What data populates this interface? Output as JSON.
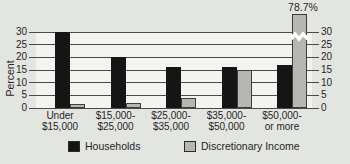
{
  "chart_data": {
    "type": "bar",
    "title": "",
    "ylabel": "Percent",
    "yticks": [
      0,
      5,
      10,
      15,
      20,
      25,
      30
    ],
    "ylim": [
      0,
      33
    ],
    "yticks_both_sides": true,
    "grid": true,
    "legend_position": "bottom",
    "categories": [
      {
        "line1": "Under",
        "line2": "$15,000"
      },
      {
        "line1": "$15,000-",
        "line2": "$25,000"
      },
      {
        "line1": "$25,000-",
        "line2": "$35,000"
      },
      {
        "line1": "$35,000-",
        "line2": "$50,000"
      },
      {
        "line1": "$50,000-",
        "line2": "or more"
      }
    ],
    "series": [
      {
        "name": "Households",
        "color": "#151515",
        "values": [
          30,
          20,
          16,
          16,
          17
        ]
      },
      {
        "name": "Discretionary Income",
        "color": "#b6b6b2",
        "values": [
          1.5,
          2,
          4,
          15,
          78.7
        ]
      }
    ],
    "broken_bar": {
      "series_index": 1,
      "category_index": 4,
      "label": "78.7%"
    }
  },
  "colors": {
    "background": "#e3e5e1",
    "plot_background": "#f3f3f0",
    "gridline": "#4a4a48",
    "text": "#262626",
    "households_bar": "#151515",
    "discretionary_bar": "#b6b6b2"
  }
}
